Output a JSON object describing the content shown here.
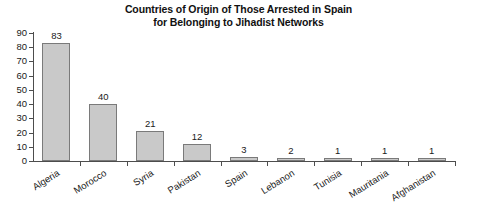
{
  "chart_data": {
    "type": "bar",
    "title": "Countries of Origin of Those Arrested in Spain for Belonging to Jihadist Networks",
    "title_lines": [
      "Countries of Origin of Those Arrested in Spain",
      "for Belonging to Jihadist Networks"
    ],
    "xlabel": "",
    "ylabel": "",
    "categories": [
      "Algeria",
      "Morocco",
      "Syria",
      "Pakistan",
      "Spain",
      "Lebanon",
      "Tunisia",
      "Mauritania",
      "Afghanistan"
    ],
    "values": [
      83,
      40,
      21,
      12,
      3,
      2,
      1,
      1,
      1
    ],
    "value_labels": [
      "83",
      "40",
      "21",
      "12",
      "3",
      "2",
      "1",
      "1",
      "1"
    ],
    "ylim": [
      0,
      90
    ],
    "yticks": [
      0,
      10,
      20,
      30,
      40,
      50,
      60,
      70,
      80,
      90
    ],
    "ytick_labels": [
      "0",
      "10",
      "20",
      "30",
      "40",
      "50",
      "60",
      "70",
      "80",
      "90"
    ],
    "grid": false,
    "legend": false,
    "bar_color": "#c9c9c9",
    "bar_border_color": "#7a7a7a",
    "axis_color": "#4d4d4d",
    "background_color": "#ffffff",
    "text_color": "#1a1a1a"
  }
}
